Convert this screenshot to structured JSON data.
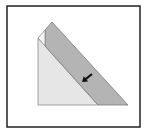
{
  "diagram": {
    "type": "origami-fold-step",
    "frame": {
      "x": 7,
      "y": 6,
      "width": 133,
      "height": 121,
      "stroke": "#222222"
    },
    "colors": {
      "background": "#ffffff",
      "paper_light": "#e6e6e6",
      "paper_band": "#b4b4b4",
      "edge": "#8a8a8a",
      "arrow": "#111111"
    },
    "shapes": {
      "light_triangle": "38,38 38,105 98,105",
      "gray_band": "52,22 128,105 98,105 45,46 45,30",
      "white_flap": "38,38 45,30 45,46",
      "back_edge": "38,38 52,22"
    },
    "arrow": {
      "direction": "down-left",
      "x1": 92,
      "y1": 74,
      "x2": 82,
      "y2": 82
    }
  }
}
